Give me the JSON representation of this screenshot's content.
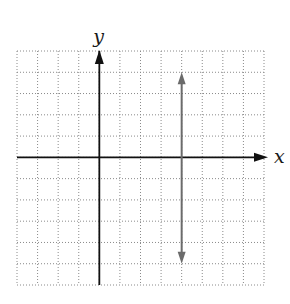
{
  "chart_data": {
    "type": "line",
    "title": "",
    "xlabel": "x",
    "ylabel": "y",
    "xlim": [
      -4,
      8
    ],
    "ylim": [
      -6,
      5
    ],
    "grid": true,
    "grid_style": "dotted",
    "series": [
      {
        "name": "vertical line x = 4",
        "x": [
          4,
          4
        ],
        "y": [
          4,
          -5
        ],
        "arrows": "both",
        "color": "#6b6b6b"
      }
    ]
  },
  "labels": {
    "x_axis": "x",
    "y_axis": "y"
  },
  "colors": {
    "axis": "#111111",
    "grid": "#8a8a8a",
    "line": "#6b6b6b"
  }
}
